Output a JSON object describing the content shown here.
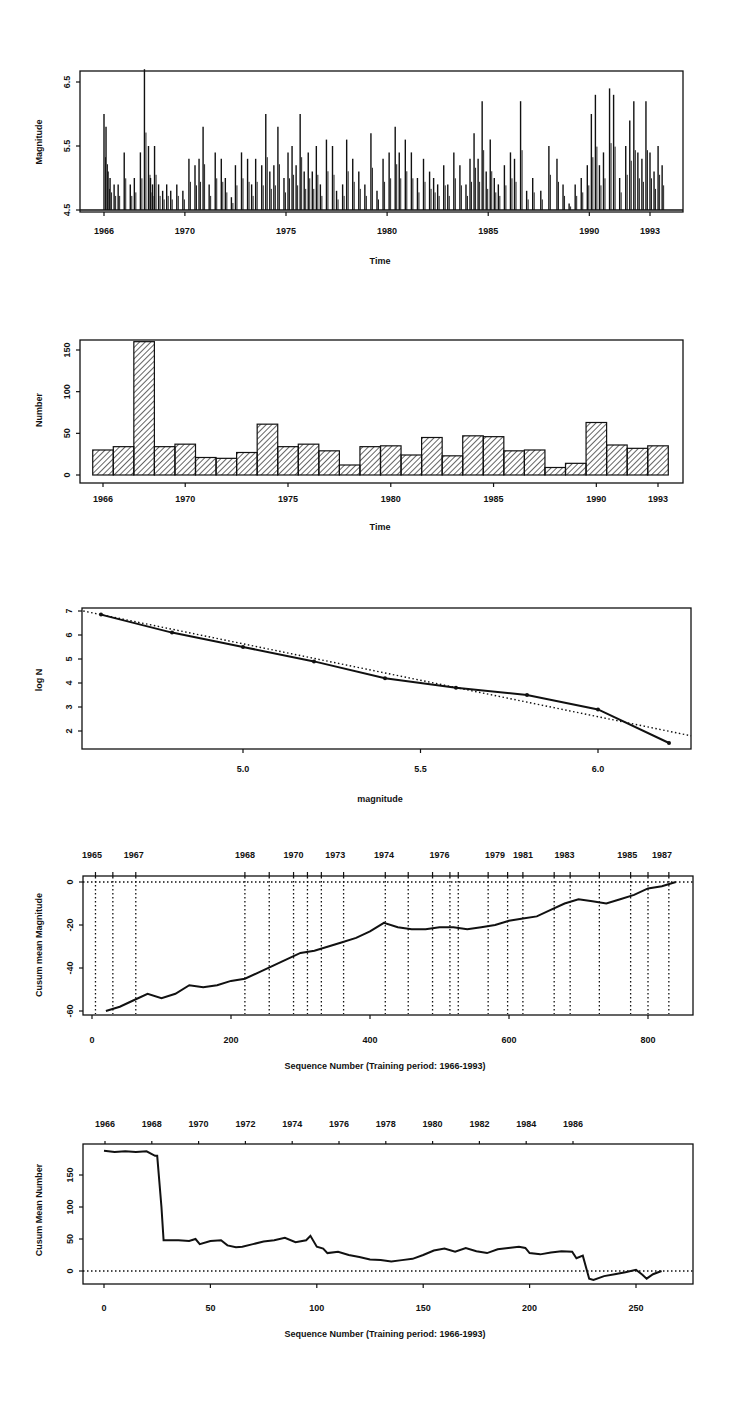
{
  "chart_data": [
    {
      "id": "magnitude-time",
      "type": "bar",
      "title": "",
      "xlabel": "Time",
      "ylabel": "Magnitude",
      "xlim": [
        1964.5,
        1994.5
      ],
      "ylim": [
        4.5,
        6.7
      ],
      "xticks": [
        1966,
        1970,
        1975,
        1980,
        1985,
        1990,
        1993
      ],
      "yticks": [
        4.5,
        5.5,
        6.5
      ],
      "description": "Spike plot of individual earthquake magnitudes (>=4.5) over time",
      "x": [
        1966.0,
        1966.1,
        1966.2,
        1966.3,
        1966.5,
        1966.7,
        1967.0,
        1967.3,
        1967.5,
        1967.8,
        1968.0,
        1968.2,
        1968.3,
        1968.4,
        1968.5,
        1968.7,
        1968.9,
        1969.1,
        1969.3,
        1969.6,
        1969.9,
        1970.2,
        1970.5,
        1970.7,
        1970.9,
        1971.2,
        1971.5,
        1971.8,
        1972.0,
        1972.3,
        1972.5,
        1972.8,
        1973.1,
        1973.3,
        1973.5,
        1973.8,
        1974.0,
        1974.2,
        1974.4,
        1974.6,
        1974.9,
        1975.1,
        1975.3,
        1975.5,
        1975.7,
        1975.9,
        1976.1,
        1976.3,
        1976.5,
        1976.7,
        1977.0,
        1977.3,
        1977.5,
        1977.8,
        1978.0,
        1978.3,
        1978.6,
        1978.9,
        1979.2,
        1979.5,
        1979.8,
        1980.1,
        1980.4,
        1980.6,
        1980.9,
        1981.2,
        1981.5,
        1981.8,
        1982.1,
        1982.3,
        1982.5,
        1982.8,
        1983.0,
        1983.3,
        1983.6,
        1983.9,
        1984.1,
        1984.3,
        1984.5,
        1984.7,
        1984.9,
        1985.1,
        1985.3,
        1985.5,
        1985.8,
        1986.1,
        1986.3,
        1986.6,
        1986.9,
        1987.2,
        1987.6,
        1988.0,
        1988.4,
        1988.7,
        1989.0,
        1989.3,
        1989.6,
        1989.9,
        1990.1,
        1990.3,
        1990.5,
        1990.7,
        1991.0,
        1991.2,
        1991.5,
        1991.8,
        1992.0,
        1992.2,
        1992.4,
        1992.6,
        1992.8,
        1993.0,
        1993.2,
        1993.4,
        1993.6
      ],
      "values": [
        6.0,
        5.8,
        5.1,
        5.0,
        4.9,
        4.9,
        5.4,
        4.9,
        5.0,
        5.4,
        6.7,
        5.5,
        5.0,
        4.9,
        5.5,
        4.9,
        4.8,
        4.9,
        4.8,
        4.9,
        4.8,
        5.3,
        5.2,
        5.3,
        5.8,
        4.9,
        5.4,
        5.3,
        5.0,
        4.7,
        5.2,
        5.4,
        5.3,
        4.9,
        5.3,
        5.2,
        6.0,
        5.1,
        5.2,
        5.8,
        5.0,
        5.4,
        5.5,
        5.2,
        6.0,
        5.1,
        5.4,
        5.1,
        5.5,
        4.9,
        5.6,
        5.5,
        4.8,
        4.9,
        5.6,
        5.3,
        5.1,
        4.9,
        5.7,
        4.8,
        5.3,
        5.4,
        5.8,
        5.4,
        5.6,
        5.4,
        5.0,
        5.3,
        5.1,
        5.0,
        4.9,
        5.2,
        4.9,
        5.4,
        5.2,
        4.9,
        5.3,
        5.7,
        5.3,
        6.2,
        5.1,
        5.6,
        5.0,
        4.9,
        5.2,
        5.4,
        5.3,
        6.2,
        4.8,
        5.0,
        4.8,
        5.5,
        5.3,
        4.9,
        4.6,
        4.9,
        5.0,
        5.2,
        6.0,
        6.3,
        5.2,
        5.4,
        6.4,
        6.3,
        5.0,
        5.5,
        5.9,
        6.2,
        5.4,
        5.3,
        6.2,
        5.4,
        5.1,
        5.5,
        5.2
      ]
    },
    {
      "id": "number-time",
      "type": "bar",
      "title": "",
      "xlabel": "Time",
      "ylabel": "Number",
      "xlim": [
        1964.5,
        1994.5
      ],
      "ylim": [
        0,
        165
      ],
      "xticks": [
        1966,
        1970,
        1975,
        1980,
        1985,
        1990,
        1993
      ],
      "yticks": [
        0,
        50,
        100,
        150
      ],
      "categories": [
        1966,
        1967,
        1968,
        1969,
        1970,
        1971,
        1972,
        1973,
        1974,
        1975,
        1976,
        1977,
        1978,
        1979,
        1980,
        1981,
        1982,
        1983,
        1984,
        1985,
        1986,
        1987,
        1988,
        1989,
        1990,
        1991,
        1992,
        1993
      ],
      "values": [
        30,
        34,
        160,
        34,
        37,
        21,
        20,
        27,
        61,
        34,
        37,
        29,
        12,
        34,
        35,
        24,
        45,
        23,
        47,
        46,
        29,
        30,
        9,
        14,
        63,
        36,
        32,
        35
      ],
      "fill": "diagonal hatch"
    },
    {
      "id": "logn-magnitude",
      "type": "line",
      "title": "",
      "xlabel": "magnitude",
      "ylabel": "log N",
      "xlim": [
        4.55,
        6.3
      ],
      "ylim": [
        1.2,
        7.1
      ],
      "xticks": [
        5.0,
        5.5,
        6.0
      ],
      "yticks": [
        2,
        3,
        4,
        5,
        6,
        7
      ],
      "series": [
        {
          "name": "observed",
          "style": "solid with markers",
          "x": [
            4.6,
            4.8,
            5.0,
            5.2,
            5.4,
            5.6,
            5.8,
            6.0,
            6.2
          ],
          "values": [
            6.85,
            6.1,
            5.5,
            4.9,
            4.2,
            3.8,
            3.5,
            2.9,
            1.5
          ]
        },
        {
          "name": "fit",
          "style": "dotted",
          "x": [
            4.55,
            6.3
          ],
          "values": [
            7.0,
            1.8
          ]
        }
      ]
    },
    {
      "id": "cusum-magnitude",
      "type": "line",
      "title": "",
      "xlabel": "Sequence Number (Training period: 1966-1993)",
      "ylabel": "Cusum mean Magnitude",
      "xlim": [
        -10,
        870
      ],
      "ylim": [
        -62,
        2
      ],
      "xticks": [
        0,
        200,
        400,
        600,
        800
      ],
      "yticks": [
        0,
        -20,
        -40,
        -60
      ],
      "top_axis_labels": [
        "1965",
        "1967",
        "1968",
        "1970",
        "1973",
        "1974",
        "1976",
        "1979",
        "1981",
        "1983",
        "1985",
        "1987"
      ],
      "top_axis_positions": [
        0,
        60,
        220,
        290,
        350,
        420,
        500,
        580,
        620,
        680,
        770,
        820
      ],
      "vertical_dotted_lines": [
        5,
        30,
        63,
        220,
        255,
        290,
        310,
        330,
        362,
        422,
        455,
        490,
        515,
        527,
        570,
        598,
        620,
        665,
        688,
        730,
        775,
        800,
        830
      ],
      "reference_line": 0,
      "x": [
        20,
        40,
        60,
        80,
        100,
        120,
        140,
        160,
        180,
        200,
        220,
        240,
        260,
        280,
        300,
        320,
        340,
        360,
        380,
        400,
        420,
        440,
        460,
        480,
        500,
        520,
        540,
        560,
        580,
        600,
        620,
        640,
        660,
        680,
        700,
        720,
        740,
        760,
        780,
        800,
        820,
        840
      ],
      "values": [
        -60,
        -58,
        -55,
        -52,
        -54,
        -52,
        -48,
        -49,
        -48,
        -46,
        -45,
        -42,
        -39,
        -36,
        -33,
        -32,
        -30,
        -28,
        -26,
        -23,
        -19,
        -21,
        -22,
        -22,
        -21,
        -21,
        -22,
        -21,
        -20,
        -18,
        -17,
        -16,
        -13,
        -10,
        -8,
        -9,
        -10,
        -8,
        -6,
        -3,
        -2,
        0
      ]
    },
    {
      "id": "cusum-number",
      "type": "line",
      "title": "",
      "xlabel": "Sequence Number (Training period: 1966-1993)",
      "ylabel": "Cusum Mean Number",
      "xlim": [
        -12,
        275
      ],
      "ylim": [
        -25,
        195
      ],
      "xticks": [
        0,
        50,
        100,
        150,
        200,
        250
      ],
      "yticks": [
        0,
        50,
        100,
        150
      ],
      "top_axis_labels": [
        "1966",
        "1968",
        "1970",
        "1972",
        "1974",
        "1976",
        "1978",
        "1980",
        "1982",
        "1984",
        "1986"
      ],
      "top_axis_positions": [
        0,
        20,
        40,
        60,
        80,
        100,
        120,
        140,
        160,
        180,
        200
      ],
      "reference_line": 0,
      "x": [
        0,
        5,
        10,
        15,
        20,
        24,
        25,
        27,
        28,
        30,
        35,
        40,
        43,
        45,
        50,
        55,
        58,
        62,
        65,
        70,
        75,
        80,
        85,
        90,
        95,
        97,
        100,
        103,
        105,
        110,
        115,
        120,
        125,
        130,
        135,
        140,
        145,
        150,
        155,
        160,
        165,
        170,
        175,
        180,
        185,
        190,
        195,
        198,
        200,
        205,
        210,
        215,
        220,
        222,
        225,
        228,
        230,
        235,
        240,
        245,
        250,
        253,
        255,
        258,
        262
      ],
      "values": [
        188,
        186,
        187,
        186,
        187,
        180,
        180,
        100,
        48,
        48,
        48,
        47,
        50,
        42,
        47,
        48,
        40,
        37,
        38,
        42,
        46,
        48,
        52,
        45,
        48,
        55,
        38,
        35,
        28,
        30,
        25,
        22,
        18,
        17,
        15,
        17,
        19,
        25,
        32,
        35,
        30,
        36,
        31,
        28,
        34,
        36,
        38,
        36,
        28,
        26,
        29,
        31,
        30,
        20,
        24,
        -12,
        -14,
        -8,
        -5,
        -2,
        2,
        -6,
        -12,
        -5,
        0
      ]
    }
  ]
}
